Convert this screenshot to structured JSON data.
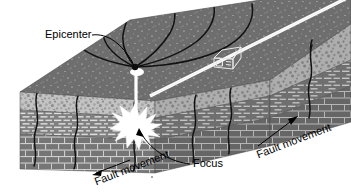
{
  "figure": {
    "type": "geologic-block-diagram",
    "background_color": "#ffffff"
  },
  "labels": {
    "epicenter": "Epicenter",
    "focus": "Focus",
    "fault_movement_left": "Fault movement",
    "fault_movement_right": "Fault movement"
  },
  "annotations": {
    "epicenter_marker": "black dot on ground surface",
    "focus_marker": "white starburst inside crust",
    "connector_line": "vertical white line from focus to epicenter",
    "arrow_left_direction": "down-left",
    "arrow_right_direction": "up-right"
  },
  "scene": {
    "surface_features": [
      "road",
      "house",
      "surface-cracks"
    ],
    "layers": [
      {
        "name": "ground-surface",
        "texture": "speckled",
        "color": "#6e6e6e"
      },
      {
        "name": "conglomerate-layer",
        "texture": "pebbles",
        "color": "#b9b9b9"
      },
      {
        "name": "fine-brick-layer",
        "texture": "thin-bricks",
        "color": "#808080"
      },
      {
        "name": "coarse-brick-layer",
        "texture": "large-bricks",
        "color": "#757575"
      }
    ],
    "seismic_waves": "concentric black wave lines radiating from epicenter"
  },
  "colors": {
    "surface": "#6e6e6e",
    "conglomerate": "#b9b9b9",
    "brick_fine": "#808080",
    "brick_coarse": "#757575",
    "side_shadow": "#5d5d5d",
    "crack": "#101010",
    "highlight": "#ffffff",
    "text": "#000000"
  }
}
